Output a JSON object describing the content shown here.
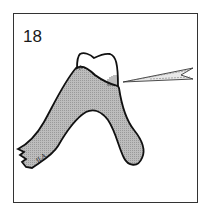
{
  "figure": {
    "number_label": "18",
    "signature": "JLA",
    "colors": {
      "frame": "#333333",
      "bone_fill": "#b8b8b8",
      "outline": "#111111",
      "crown_fill": "#ffffff",
      "background": "#ffffff"
    },
    "elements": [
      "tooth-crown",
      "alveolar-bone",
      "injection-needle",
      "hatching"
    ]
  }
}
